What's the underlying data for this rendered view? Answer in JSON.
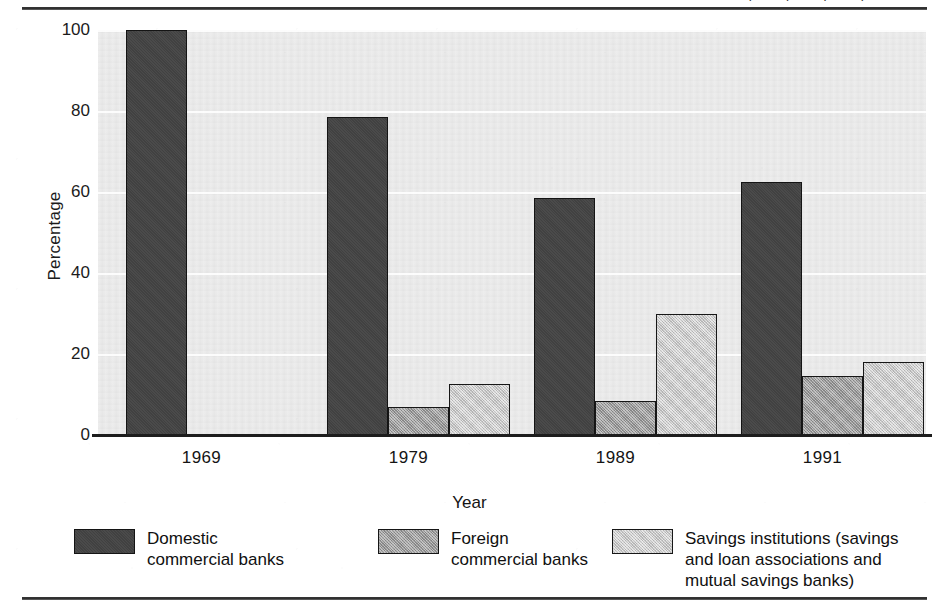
{
  "figure": {
    "title_fragment": "COMPARING, 1969, 1979, 1989, AND 1991",
    "y_axis_title": "Percentage",
    "x_axis_title": "Year"
  },
  "chart_data": {
    "type": "bar",
    "title": "COMPARING, 1969, 1979, 1989, AND 1991",
    "xlabel": "Year",
    "ylabel": "Percentage",
    "ylim": [
      0,
      100
    ],
    "yticks": [
      0,
      20,
      40,
      60,
      80,
      100
    ],
    "ytick_labels": [
      "0",
      "20",
      "40",
      "60",
      "80",
      "100"
    ],
    "grid": true,
    "legend_position": "bottom",
    "categories": [
      "1969",
      "1979",
      "1989",
      "1991"
    ],
    "series": [
      {
        "name": "Domestic commercial banks",
        "color": "#444444",
        "values": [
          100,
          78.5,
          58.5,
          62.5
        ]
      },
      {
        "name": "Foreign commercial banks",
        "color": "#a6a6a6",
        "values": [
          null,
          7,
          8.5,
          14.5
        ]
      },
      {
        "name": "Savings institutions (savings and loan associations and mutual savings banks)",
        "color": "#cfcfcf",
        "values": [
          null,
          12.5,
          30,
          18
        ]
      }
    ]
  },
  "legend": [
    {
      "swatch": "dark",
      "label": "Domestic\ncommercial banks"
    },
    {
      "swatch": "mid",
      "label": "Foreign\ncommercial banks"
    },
    {
      "swatch": "light",
      "label": "Savings institutions (savings\nand loan associations and\nmutual savings banks)"
    }
  ]
}
